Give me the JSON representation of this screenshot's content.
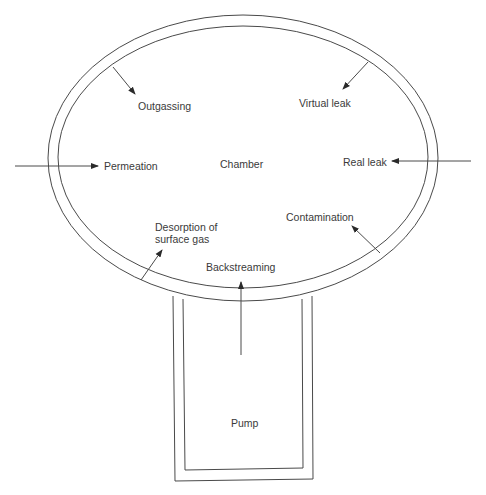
{
  "diagram": {
    "chamber_label": "Chamber",
    "pump_label": "Pump",
    "processes": {
      "outgassing": "Outgassing",
      "virtual_leak": "Virtual leak",
      "permeation": "Permeation",
      "real_leak": "Real leak",
      "desorption": "Desorption of\nsurface gas",
      "contamination": "Contamination",
      "backstreaming": "Backstreaming"
    },
    "colors": {
      "line": "#4a4a4a",
      "text": "#3a3a3a",
      "background": "#ffffff"
    }
  }
}
